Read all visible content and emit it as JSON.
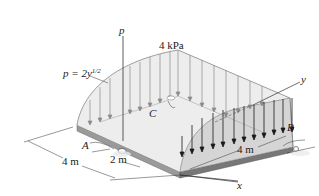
{
  "figure": {
    "type": "3d-distributed-load-diagram",
    "labels": {
      "p_axis": "p",
      "load_equation_prefix": "p = 2y",
      "load_equation_exponent": "1/2",
      "peak_load": "4 kPa",
      "y_axis": "y",
      "x_axis": "x",
      "point_a": "A",
      "point_b": "B",
      "point_c": "C",
      "dim_width_left": "4 m",
      "dim_a_offset": "2 m",
      "dim_length_right": "4 m"
    },
    "colors": {
      "plate_top": "#e6e6e6",
      "plate_edge": "#8a8a8a",
      "load_fill": "#ececec",
      "front_load_fill": "#d8d8d8",
      "arrow_light": "#8a8a8a",
      "arrow_dark": "#1a1a1a",
      "line": "#444444"
    }
  }
}
